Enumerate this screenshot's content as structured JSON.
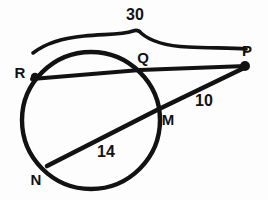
{
  "figure": {
    "background_color": "#fdfdfd",
    "ink_color": "#121212",
    "points": [
      {
        "id": "R",
        "label": "R",
        "label_x": 20,
        "label_y": 72,
        "x": 35,
        "y": 77,
        "dot": true
      },
      {
        "id": "Q",
        "label": "Q",
        "label_x": 143,
        "label_y": 57,
        "x": 140,
        "y": 70,
        "dot": false
      },
      {
        "id": "P",
        "label": "P",
        "label_x": 247,
        "label_y": 50,
        "x": 245,
        "y": 66,
        "dot": true
      },
      {
        "id": "M",
        "label": "M",
        "label_x": 168,
        "label_y": 119,
        "x": 157,
        "y": 110,
        "dot": false
      },
      {
        "id": "N",
        "label": "N",
        "label_x": 36,
        "label_y": 179,
        "x": 49,
        "y": 164,
        "dot": false
      }
    ],
    "measures": [
      {
        "id": "RP",
        "label": "30",
        "x": 135,
        "y": 15,
        "segment": "R to P",
        "brace": true
      },
      {
        "id": "MP",
        "label": "10",
        "x": 204,
        "y": 101,
        "segment": "M to P",
        "brace": false
      },
      {
        "id": "NM",
        "label": "14",
        "x": 106,
        "y": 152,
        "segment": "N to M",
        "brace": false
      }
    ],
    "circle": {
      "cx": 91,
      "cy": 120,
      "r": 68
    },
    "secant_RP": {
      "x1": 33,
      "y1": 78,
      "x2": 246,
      "y2": 66
    },
    "secant_NP": {
      "x1": 48,
      "y1": 165,
      "x2": 246,
      "y2": 67
    },
    "brace": {
      "left_x": 33,
      "left_y": 52,
      "peak_x": 135,
      "peak_y": 33,
      "right_x": 246,
      "right_y": 50
    }
  }
}
